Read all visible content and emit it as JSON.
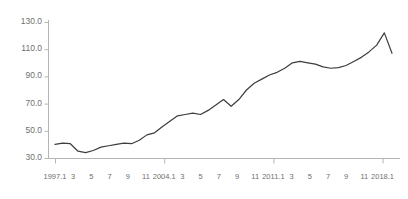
{
  "chart_data": {
    "type": "line",
    "title": "",
    "subtitle": "",
    "xlabel": "",
    "ylabel": "",
    "grid": false,
    "legend": false,
    "legend_position": "none",
    "line_color": "#3d3d3d",
    "axis_color": "#b5b5b5",
    "tick_label_color": "#6f6f6f",
    "background": "#ffffff",
    "ylim": [
      30.0,
      130.0
    ],
    "yticks": [
      30.0,
      50.0,
      70.0,
      90.0,
      110.0,
      130.0
    ],
    "ytick_labels": [
      "30.0",
      "50.0",
      "70.0",
      "90.0",
      "110.0",
      "130.0"
    ],
    "xlim": [
      "1997.1",
      "2018.7"
    ],
    "xtick_labels": [
      "1997.1",
      "3",
      "5",
      "7",
      "9",
      "11",
      "2004.1",
      "3",
      "5",
      "7",
      "9",
      "11",
      "2011.1",
      "3",
      "5",
      "7",
      "9",
      "11",
      "2018.1"
    ],
    "xtick_major": [
      "1997.1",
      "2004.1",
      "2011.1",
      "2018.1"
    ],
    "x": [
      "1997.1",
      "1997.7",
      "1998.1",
      "1998.7",
      "1999.1",
      "1999.7",
      "2000.1",
      "2000.7",
      "2001.1",
      "2001.7",
      "2002.1",
      "2002.7",
      "2003.1",
      "2003.7",
      "2004.1",
      "2004.7",
      "2005.1",
      "2005.7",
      "2006.1",
      "2006.7",
      "2007.1",
      "2007.7",
      "2008.1",
      "2008.7",
      "2009.1",
      "2009.7",
      "2010.1",
      "2010.7",
      "2011.1",
      "2011.7",
      "2012.1",
      "2012.7",
      "2013.1",
      "2013.7",
      "2014.1",
      "2014.7",
      "2015.1",
      "2015.7",
      "2016.1",
      "2016.7",
      "2017.1",
      "2017.7",
      "2018.1",
      "2018.4",
      "2018.5"
    ],
    "values": [
      40.0,
      41.0,
      40.5,
      35.0,
      34.0,
      35.5,
      38.0,
      39.0,
      40.0,
      41.0,
      40.5,
      43.0,
      47.0,
      48.5,
      53.0,
      57.0,
      61.0,
      62.0,
      63.0,
      62.0,
      65.0,
      69.0,
      73.0,
      68.0,
      73.0,
      80.0,
      85.0,
      88.0,
      91.0,
      93.0,
      96.0,
      100.0,
      101.0,
      100.0,
      99.0,
      97.0,
      96.0,
      96.5,
      98.0,
      101.0,
      104.0,
      108.0,
      113.0,
      122.0,
      107.0
    ],
    "series": [
      {
        "name": "index",
        "color": "#3d3d3d",
        "values": [
          40.0,
          41.0,
          40.5,
          35.0,
          34.0,
          35.5,
          38.0,
          39.0,
          40.0,
          41.0,
          40.5,
          43.0,
          47.0,
          48.5,
          53.0,
          57.0,
          61.0,
          62.0,
          63.0,
          62.0,
          65.0,
          69.0,
          73.0,
          68.0,
          73.0,
          80.0,
          85.0,
          88.0,
          91.0,
          93.0,
          96.0,
          100.0,
          101.0,
          100.0,
          99.0,
          97.0,
          96.0,
          96.5,
          98.0,
          101.0,
          104.0,
          108.0,
          113.0,
          122.0,
          107.0
        ]
      }
    ],
    "annotations": []
  },
  "axes": {
    "y_tick_labels": [
      "130.0",
      "110.0",
      "90.0",
      "70.0",
      "50.0",
      "30.0"
    ],
    "x_tick_labels": [
      {
        "label": "1997.1",
        "major": true
      },
      {
        "label": "3",
        "major": false
      },
      {
        "label": "5",
        "major": false
      },
      {
        "label": "7",
        "major": false
      },
      {
        "label": "9",
        "major": false
      },
      {
        "label": "11",
        "major": false
      },
      {
        "label": "2004.1",
        "major": true
      },
      {
        "label": "3",
        "major": false
      },
      {
        "label": "5",
        "major": false
      },
      {
        "label": "7",
        "major": false
      },
      {
        "label": "9",
        "major": false
      },
      {
        "label": "11",
        "major": false
      },
      {
        "label": "2011.1",
        "major": true
      },
      {
        "label": "3",
        "major": false
      },
      {
        "label": "5",
        "major": false
      },
      {
        "label": "7",
        "major": false
      },
      {
        "label": "9",
        "major": false
      },
      {
        "label": "11",
        "major": false
      },
      {
        "label": "2018.1",
        "major": true
      }
    ]
  }
}
